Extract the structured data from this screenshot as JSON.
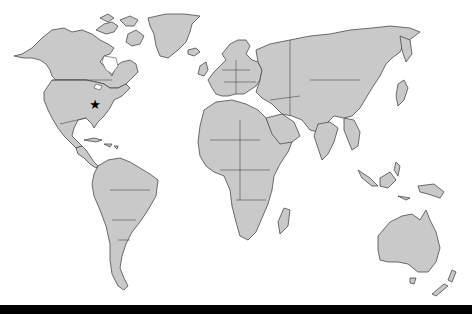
{
  "map": {
    "type": "world political outline map",
    "colors": {
      "land": "#c9c9c9",
      "border": "#4a4a4a",
      "water": "#ffffff",
      "marker": "#000000",
      "bottom_bar": "#000000"
    },
    "marker": {
      "icon": "star-icon",
      "glyph": "★",
      "x": 95,
      "y": 105,
      "region": "eastern United States"
    }
  }
}
